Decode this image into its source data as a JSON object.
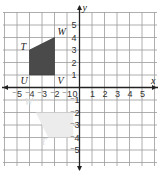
{
  "diagram": {
    "type": "coordinate-plane",
    "x_axis_label": "x",
    "y_axis_label": "y",
    "x_range": [
      -5,
      5
    ],
    "y_range": [
      -5,
      5
    ],
    "x_tick_labels": [
      "-5",
      "-4",
      "-3",
      "-2",
      "-1",
      "0",
      "1",
      "2",
      "3",
      "4",
      "5"
    ],
    "y_tick_labels": [
      "5",
      "4",
      "3",
      "2",
      "1",
      "-1",
      "-2",
      "-3",
      "-4",
      "-5"
    ],
    "origin_label": "0",
    "shape": {
      "name": "TUVW",
      "fill": "#4a4a4a",
      "vertices": [
        {
          "label": "T",
          "x": -4,
          "y": 3
        },
        {
          "label": "W",
          "x": -2,
          "y": 4
        },
        {
          "label": "V",
          "x": -2,
          "y": 1
        },
        {
          "label": "U",
          "x": -4,
          "y": 1
        }
      ]
    },
    "ghost_shape": {
      "fill": "#ececec",
      "vertices": [
        {
          "x": -3.5,
          "y": -2
        },
        {
          "x": -0.5,
          "y": -2
        },
        {
          "x": -0.5,
          "y": -4
        },
        {
          "x": -2.5,
          "y": -4
        }
      ],
      "labels": [
        {
          "label": "W",
          "x": -4.4,
          "y": -1.4
        },
        {
          "label": "T",
          "x": -3.1,
          "y": -4.6
        }
      ]
    },
    "colors": {
      "grid": "#9a9a9a",
      "axis": "#222222"
    }
  }
}
